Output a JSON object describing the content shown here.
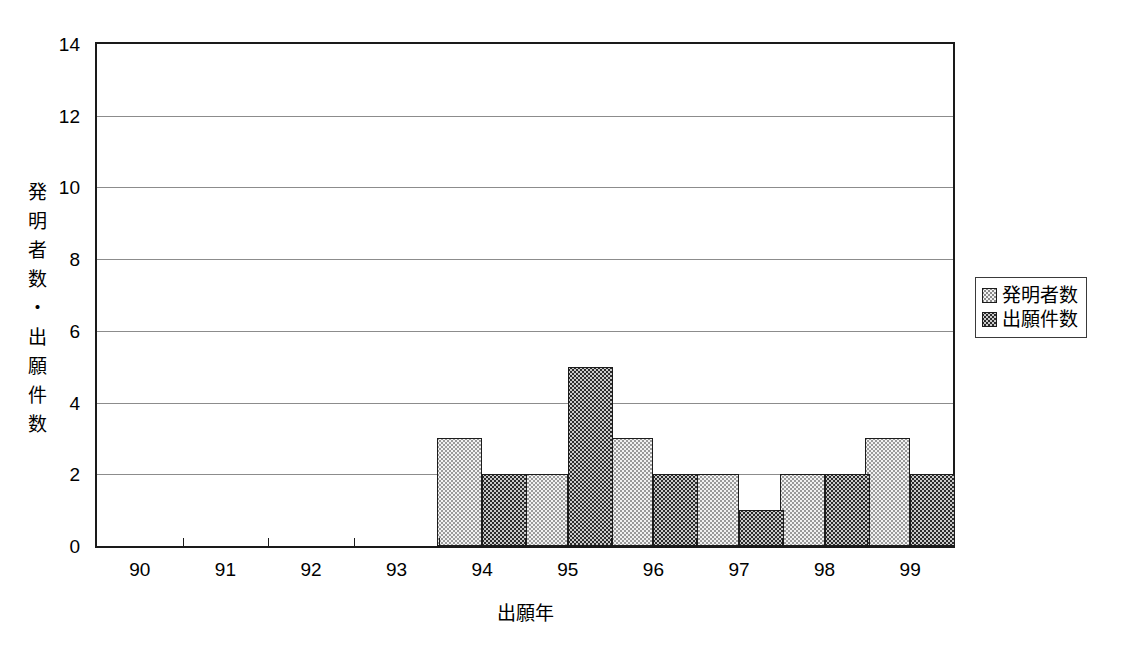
{
  "chart_data": {
    "type": "bar",
    "title": "",
    "subtitle": "",
    "xlabel": "出願年",
    "ylabel": "発明者数・出願件数",
    "categories": [
      "90",
      "91",
      "92",
      "93",
      "94",
      "95",
      "96",
      "97",
      "98",
      "99"
    ],
    "series": [
      {
        "name": "発明者数",
        "values": [
          0,
          0,
          0,
          0,
          3,
          2,
          3,
          2,
          2,
          3
        ],
        "color": "#f2f2f2",
        "pattern": "light-dotted"
      },
      {
        "name": "出願件数",
        "values": [
          0,
          0,
          0,
          0,
          2,
          5,
          2,
          1,
          2,
          2
        ],
        "color": "#2b2b2b",
        "pattern": "dark-dotted"
      }
    ],
    "ylim": [
      0,
      14
    ],
    "ytick_values": [
      0,
      2,
      4,
      6,
      8,
      10,
      12,
      14
    ],
    "ytick_labels": [
      "0",
      "2",
      "4",
      "6",
      "8",
      "10",
      "12",
      "14"
    ],
    "grid": "horizontal",
    "legend_position": "right"
  },
  "axes": {
    "y_title_chars": [
      "発",
      "明",
      "者",
      "数",
      "・",
      "出",
      "願",
      "件",
      "数"
    ],
    "y_title_text": "発明者数・出願件数",
    "x_title_text": "出願年"
  },
  "legend": {
    "entries": [
      {
        "label": "発明者数"
      },
      {
        "label": "出願件数"
      }
    ]
  }
}
